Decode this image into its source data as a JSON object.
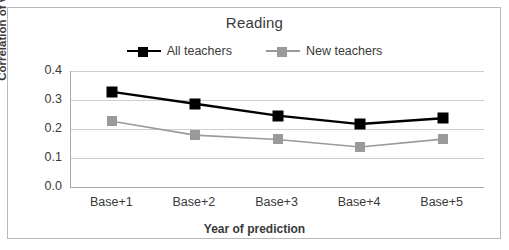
{
  "chart_data": {
    "type": "line",
    "title": "Reading",
    "xlabel": "Year of prediction",
    "ylabel": "Correlation of value-added",
    "categories": [
      "Base+1",
      "Base+2",
      "Base+3",
      "Base+4",
      "Base+5"
    ],
    "ylim": [
      0.0,
      0.4
    ],
    "yticks": [
      "0.0",
      "0.1",
      "0.2",
      "0.3",
      "0.4"
    ],
    "ytick_values": [
      0.0,
      0.1,
      0.2,
      0.3,
      0.4
    ],
    "grid": "horizontal",
    "legend_position": "top-center",
    "series": [
      {
        "name": "All teachers",
        "color": "#000000",
        "marker": "square",
        "values": [
          0.328,
          0.287,
          0.246,
          0.217,
          0.237
        ]
      },
      {
        "name": "New teachers",
        "color": "#9a9a9a",
        "marker": "square",
        "values": [
          0.227,
          0.179,
          0.164,
          0.138,
          0.165
        ]
      }
    ]
  },
  "colors": {
    "all_teachers": "#000000",
    "new_teachers": "#9a9a9a",
    "axis": "#a8a8a8",
    "gridline": "#cfcfcf",
    "border": "#b9b9b9",
    "text": "#3a3a3a"
  }
}
